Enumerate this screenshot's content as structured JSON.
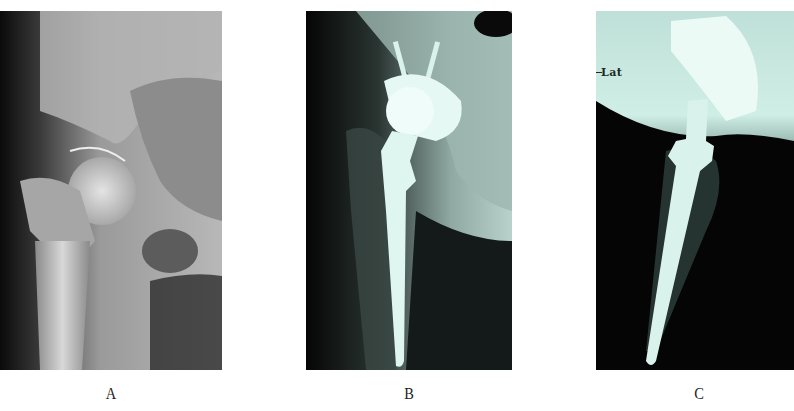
{
  "figure": {
    "panels": [
      {
        "id": "A",
        "label": "A",
        "description": "Preoperative AP radiograph of the hip joint (grayscale)",
        "tone": "grayscale"
      },
      {
        "id": "B",
        "label": "B",
        "description": "Postoperative AP radiograph after total hip arthroplasty showing femoral stem, femoral head and acetabular cup with screws",
        "tone": "cyan-tinted"
      },
      {
        "id": "C",
        "label": "C",
        "description": "Postoperative lateral radiograph showing femoral stem within femur",
        "tone": "cyan-tinted",
        "marker_text": "Lat"
      }
    ]
  },
  "colors": {
    "background": "#ffffff",
    "xray_dark": "#050505",
    "xray_gray": "#9a9a9a",
    "xray_cyan": "#cfeee6",
    "label_text": "#222222"
  }
}
